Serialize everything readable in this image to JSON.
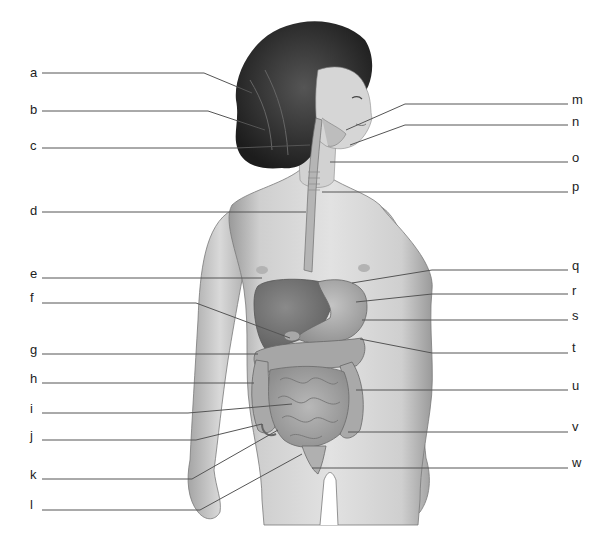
{
  "diagram": {
    "type": "anatomical-labeling",
    "colors": {
      "background": "#ffffff",
      "skin": "#d8d8d8",
      "skin_shadow": "#9a9a9a",
      "hair": "#2a2a2a",
      "organ_dark": "#6e6e6e",
      "organ_mid": "#9c9c9c",
      "organ_light": "#bdbdbd",
      "leader_line": "#555555",
      "label_text": "#222222"
    },
    "labels_left": [
      {
        "id": "a",
        "text": "a",
        "y": 73,
        "line": [
          [
            42,
            73
          ],
          [
            204,
            73
          ],
          [
            252,
            93
          ]
        ]
      },
      {
        "id": "b",
        "text": "b",
        "y": 110,
        "line": [
          [
            42,
            111
          ],
          [
            208,
            111
          ],
          [
            265,
            130
          ]
        ]
      },
      {
        "id": "c",
        "text": "c",
        "y": 146,
        "line": [
          [
            42,
            148
          ],
          [
            236,
            148
          ],
          [
            310,
            145
          ]
        ]
      },
      {
        "id": "d",
        "text": "d",
        "y": 211,
        "line": [
          [
            42,
            212
          ],
          [
            306,
            212
          ]
        ]
      },
      {
        "id": "e",
        "text": "e",
        "y": 274,
        "line": [
          [
            42,
            278
          ],
          [
            262,
            278
          ]
        ]
      },
      {
        "id": "f",
        "text": "f",
        "y": 298,
        "line": [
          [
            42,
            303
          ],
          [
            196,
            303
          ],
          [
            290,
            338
          ]
        ]
      },
      {
        "id": "g",
        "text": "g",
        "y": 350,
        "line": [
          [
            42,
            354
          ],
          [
            258,
            354
          ]
        ]
      },
      {
        "id": "h",
        "text": "h",
        "y": 379,
        "line": [
          [
            42,
            383
          ],
          [
            254,
            383
          ]
        ]
      },
      {
        "id": "i",
        "text": "i",
        "y": 409,
        "line": [
          [
            42,
            413
          ],
          [
            188,
            413
          ],
          [
            292,
            404
          ]
        ]
      },
      {
        "id": "j",
        "text": "j",
        "y": 436,
        "line": [
          [
            42,
            440
          ],
          [
            196,
            440
          ],
          [
            262,
            424
          ]
        ]
      },
      {
        "id": "k",
        "text": "k",
        "y": 475,
        "line": [
          [
            42,
            479
          ],
          [
            192,
            479
          ],
          [
            278,
            430
          ]
        ]
      },
      {
        "id": "l",
        "text": "l",
        "y": 505,
        "line": [
          [
            42,
            510
          ],
          [
            200,
            510
          ],
          [
            302,
            454
          ]
        ]
      }
    ],
    "labels_right": [
      {
        "id": "m",
        "text": "m",
        "y": 100,
        "line": [
          [
            568,
            104
          ],
          [
            405,
            104
          ],
          [
            346,
            130
          ]
        ]
      },
      {
        "id": "n",
        "text": "n",
        "y": 122,
        "line": [
          [
            568,
            125
          ],
          [
            405,
            125
          ],
          [
            350,
            145
          ]
        ]
      },
      {
        "id": "o",
        "text": "o",
        "y": 158,
        "line": [
          [
            568,
            162
          ],
          [
            330,
            162
          ]
        ]
      },
      {
        "id": "p",
        "text": "p",
        "y": 187,
        "line": [
          [
            568,
            192
          ],
          [
            322,
            192
          ]
        ]
      },
      {
        "id": "q",
        "text": "q",
        "y": 266,
        "line": [
          [
            568,
            270
          ],
          [
            432,
            270
          ],
          [
            352,
            283
          ]
        ]
      },
      {
        "id": "r",
        "text": "r",
        "y": 291,
        "line": [
          [
            568,
            294
          ],
          [
            432,
            294
          ],
          [
            356,
            302
          ]
        ]
      },
      {
        "id": "s",
        "text": "s",
        "y": 316,
        "line": [
          [
            568,
            320
          ],
          [
            362,
            320
          ]
        ]
      },
      {
        "id": "t",
        "text": "t",
        "y": 348,
        "line": [
          [
            568,
            353
          ],
          [
            432,
            353
          ],
          [
            360,
            339
          ]
        ]
      },
      {
        "id": "u",
        "text": "u",
        "y": 382,
        "line": [
          [
            568,
            390
          ],
          [
            356,
            390
          ]
        ]
      },
      {
        "id": "v",
        "text": "v",
        "y": 424,
        "line": [
          [
            568,
            432
          ],
          [
            348,
            432
          ]
        ]
      },
      {
        "id": "w",
        "text": "w",
        "y": 460,
        "line": [
          [
            568,
            468
          ],
          [
            312,
            468
          ]
        ]
      }
    ]
  }
}
